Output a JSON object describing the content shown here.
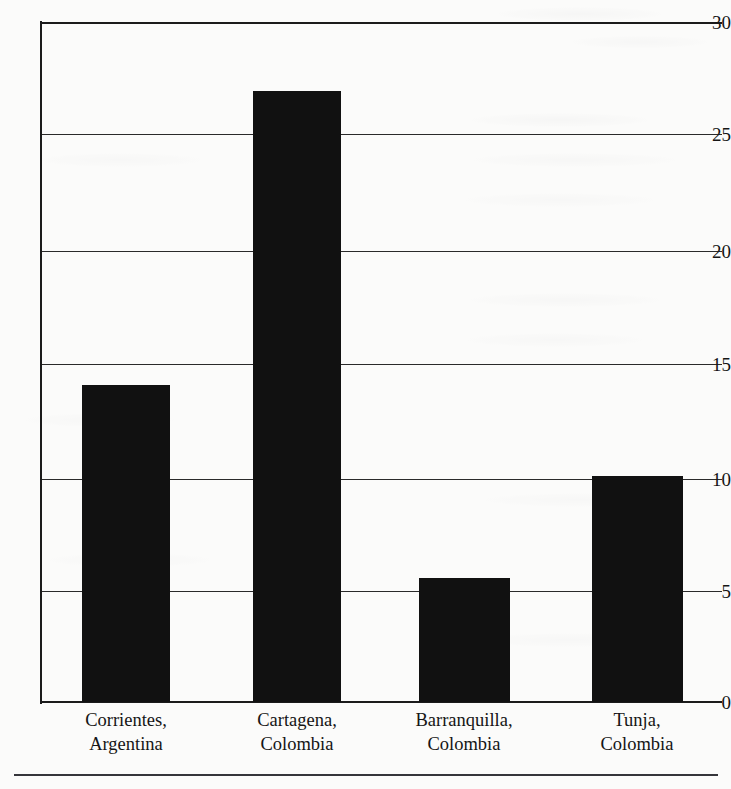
{
  "chart_data": {
    "type": "bar",
    "title": "",
    "subtitle": "",
    "xlabel": "",
    "ylabel": "",
    "categories": [
      "Corrientes, Argentina",
      "Cartagena, Colombia",
      "Barranquilla, Colombia",
      "Tunja, Colombia"
    ],
    "category_lines": [
      {
        "line1": "Corrientes,",
        "line2": "Argentina"
      },
      {
        "line1": "Cartagena,",
        "line2": "Colombia"
      },
      {
        "line1": "Barranquilla,",
        "line2": "Colombia"
      },
      {
        "line1": "Tunja,",
        "line2": "Colombia"
      }
    ],
    "values": [
      14,
      27,
      5.5,
      10
    ],
    "series": [
      {
        "name": "",
        "values": [
          14,
          27,
          5.5,
          10
        ]
      }
    ],
    "ylim": [
      0,
      30
    ],
    "ytick_labels": [
      "30",
      "25",
      "20",
      "15",
      "10",
      "5",
      "0"
    ],
    "ytick_values": [
      30,
      25,
      20,
      15,
      10,
      5,
      0
    ],
    "grid": "horizontal",
    "legend": "none",
    "bar_color": "#111111",
    "axis_color": "#1b1b1b",
    "background_color": "#fbfbfa",
    "annotations": []
  }
}
